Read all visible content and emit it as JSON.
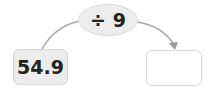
{
  "operation": {
    "symbol": "÷",
    "operand": "9",
    "label": "÷ 9"
  },
  "input": {
    "value": "54.9"
  },
  "output": {
    "value": ""
  },
  "colors": {
    "node_fill": "#ececec",
    "border": "#d4d4d4",
    "arrow": "#9a9a9a"
  }
}
